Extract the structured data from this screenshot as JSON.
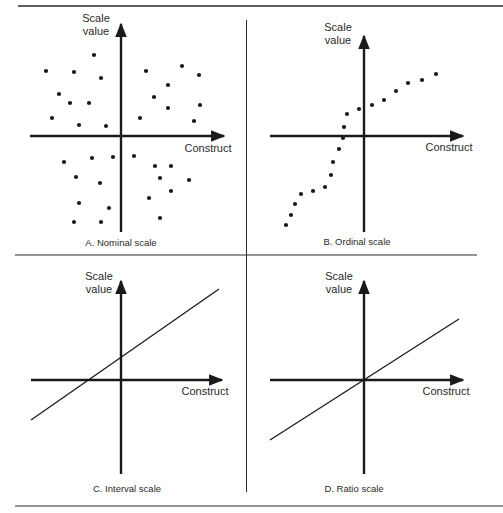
{
  "figure": {
    "header_fragment": "FIGURE 1",
    "rule_color": "#2b2b2b",
    "ink_color": "#1a1a1a"
  },
  "panels": [
    {
      "id": "A",
      "caption": "A. Nominal scale",
      "y_label_line1": "Scale",
      "y_label_line2": "value",
      "x_label": "Construct"
    },
    {
      "id": "B",
      "caption": "B. Ordinal scale",
      "y_label_line1": "Scale",
      "y_label_line2": "value",
      "x_label": "Construct"
    },
    {
      "id": "C",
      "caption": "C. Interval scale",
      "y_label_line1": "Scale",
      "y_label_line2": "value",
      "x_label": "Construct"
    },
    {
      "id": "D",
      "caption": "D. Ratio scale",
      "y_label_line1": "Scale",
      "y_label_line2": "value",
      "x_label": "Construct"
    }
  ],
  "chart_data": [
    {
      "type": "scatter",
      "title": "A. Nominal scale",
      "xlabel": "Construct",
      "ylabel": "Scale value",
      "grid": false,
      "description": "Randomly scattered points in all four quadrants; no ordering relationship",
      "points_px": [
        [
          46,
          71
        ],
        [
          74,
          72
        ],
        [
          94,
          55
        ],
        [
          101,
          78
        ],
        [
          59,
          94
        ],
        [
          70,
          103
        ],
        [
          89,
          103
        ],
        [
          52,
          118
        ],
        [
          79,
          125
        ],
        [
          106,
          126
        ],
        [
          146,
          71
        ],
        [
          182,
          66
        ],
        [
          199,
          75
        ],
        [
          168,
          85
        ],
        [
          154,
          97
        ],
        [
          168,
          108
        ],
        [
          200,
          105
        ],
        [
          140,
          118
        ],
        [
          194,
          121
        ],
        [
          64,
          162
        ],
        [
          92,
          158
        ],
        [
          113,
          157
        ],
        [
          134,
          156
        ],
        [
          155,
          166
        ],
        [
          171,
          166
        ],
        [
          76,
          177
        ],
        [
          100,
          183
        ],
        [
          160,
          178
        ],
        [
          189,
          180
        ],
        [
          171,
          191
        ],
        [
          79,
          203
        ],
        [
          109,
          208
        ],
        [
          149,
          198
        ],
        [
          74,
          222
        ],
        [
          101,
          222
        ],
        [
          160,
          218
        ]
      ]
    },
    {
      "type": "scatter",
      "title": "B. Ordinal scale",
      "xlabel": "Construct",
      "ylabel": "Scale value",
      "grid": false,
      "description": "Monotonically increasing but non-linear sequence of points",
      "points_px": [
        [
          286,
          225
        ],
        [
          291,
          215
        ],
        [
          295,
          204
        ],
        [
          301,
          194
        ],
        [
          313,
          191
        ],
        [
          325,
          187
        ],
        [
          331,
          175
        ],
        [
          333,
          162
        ],
        [
          339,
          149
        ],
        [
          343,
          138
        ],
        [
          344,
          127
        ],
        [
          347,
          114
        ],
        [
          359,
          109
        ],
        [
          372,
          105
        ],
        [
          384,
          100
        ],
        [
          396,
          91
        ],
        [
          408,
          83
        ],
        [
          422,
          80
        ],
        [
          436,
          74
        ]
      ]
    },
    {
      "type": "line",
      "title": "C. Interval scale",
      "xlabel": "Construct",
      "ylabel": "Scale value",
      "grid": false,
      "description": "Straight line with positive slope and non-zero intercept (crosses y-axis above origin)",
      "line_px": [
        [
          31,
          420
        ],
        [
          219,
          289
        ]
      ]
    },
    {
      "type": "line",
      "title": "D. Ratio scale",
      "xlabel": "Construct",
      "ylabel": "Scale value",
      "grid": false,
      "description": "Straight line with positive slope passing through the origin",
      "line_px": [
        [
          270,
          440
        ],
        [
          459,
          319
        ]
      ]
    }
  ]
}
